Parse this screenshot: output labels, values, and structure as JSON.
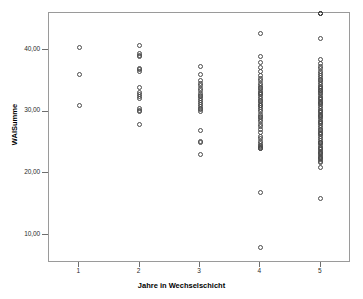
{
  "chart_data": {
    "type": "scatter",
    "title": "",
    "xlabel": "Jahre in Wechselschicht",
    "ylabel": "WAISumme",
    "grid": false,
    "legend": null,
    "xlim": [
      0.5,
      5.5
    ],
    "ylim": [
      5.5,
      46.0
    ],
    "xticks": [
      1,
      2,
      3,
      4,
      5
    ],
    "xticklabels": [
      "1",
      "2",
      "3",
      "4",
      "5"
    ],
    "yticks": [
      10,
      20,
      30,
      40
    ],
    "yticklabels": [
      "10,00",
      "20,00",
      "30,00",
      "40,00"
    ],
    "marker": "open-circle",
    "marker_color": "#4a4a4a",
    "x": [
      1,
      1,
      1,
      2,
      2,
      2,
      2,
      2,
      2,
      2,
      2,
      2,
      2,
      2,
      2,
      2,
      2,
      2,
      2,
      3,
      3,
      3,
      3,
      3,
      3,
      3,
      3,
      3,
      3,
      3,
      3,
      3,
      3,
      3,
      3,
      3,
      3,
      3,
      3,
      3,
      3,
      4,
      4,
      4,
      4,
      4,
      4,
      4,
      4,
      4,
      4,
      4,
      4,
      4,
      4,
      4,
      4,
      4,
      4,
      4,
      4,
      4,
      4,
      4,
      4,
      4,
      4,
      4,
      4,
      4,
      4,
      4,
      4,
      4,
      4,
      4,
      4,
      4,
      4,
      4,
      4,
      4,
      4,
      4,
      4,
      4,
      4,
      5,
      5,
      5,
      5,
      5,
      5,
      5,
      5,
      5,
      5,
      5,
      5,
      5,
      5,
      5,
      5,
      5,
      5,
      5,
      5,
      5,
      5,
      5,
      5,
      5,
      5,
      5,
      5,
      5,
      5,
      5,
      5,
      5,
      5,
      5,
      5,
      5,
      5,
      5,
      5,
      5,
      5,
      5,
      5,
      5,
      5,
      5,
      5,
      5,
      5,
      5,
      5,
      5,
      5,
      5,
      5,
      5,
      5,
      5,
      5,
      5,
      5,
      5,
      5,
      5,
      5,
      5,
      5,
      5,
      5,
      5,
      5,
      5,
      5,
      5,
      5
    ],
    "y": [
      40.4,
      36.0,
      31.0,
      40.8,
      39.4,
      39.1,
      38.9,
      37.0,
      36.8,
      36.6,
      34.0,
      33.2,
      32.8,
      32.5,
      32.2,
      30.5,
      30.2,
      30.0,
      28.0,
      37.4,
      36.0,
      35.0,
      34.6,
      34.2,
      33.8,
      33.4,
      33.0,
      32.7,
      32.4,
      32.1,
      31.8,
      31.5,
      31.2,
      30.9,
      30.6,
      30.3,
      30.0,
      27.0,
      25.2,
      25.0,
      23.0,
      42.6,
      39.0,
      38.0,
      37.2,
      36.5,
      35.9,
      35.4,
      35.0,
      34.6,
      34.3,
      34.0,
      33.7,
      33.4,
      33.1,
      32.8,
      32.5,
      32.2,
      31.9,
      31.6,
      31.3,
      31.0,
      30.7,
      30.4,
      30.0,
      29.6,
      29.2,
      28.8,
      28.4,
      28.0,
      27.6,
      27.2,
      26.6,
      26.0,
      25.6,
      25.2,
      24.9,
      24.6,
      24.4,
      24.2,
      24.0,
      24.0,
      16.9,
      8.0,
      33.0,
      31.0,
      29.0,
      41.8,
      38.4,
      37.8,
      37.4,
      37.0,
      36.6,
      36.2,
      35.9,
      35.6,
      35.3,
      35.0,
      34.7,
      34.4,
      34.1,
      33.8,
      33.5,
      33.2,
      32.9,
      32.6,
      32.3,
      32.0,
      31.7,
      31.4,
      31.1,
      30.8,
      30.5,
      30.2,
      29.9,
      29.6,
      29.3,
      29.0,
      28.7,
      28.4,
      28.1,
      27.8,
      27.5,
      27.2,
      26.9,
      26.6,
      26.3,
      26.0,
      25.7,
      25.4,
      25.1,
      24.8,
      24.5,
      24.2,
      23.9,
      23.6,
      23.3,
      23.0,
      22.7,
      22.4,
      22.2,
      22.0,
      21.8,
      21.0,
      16.0,
      34.0,
      33.5,
      32.2,
      31.5,
      30.0,
      29.4,
      28.2,
      26.4,
      25.0,
      24.0,
      23.4,
      22.6
    ]
  }
}
